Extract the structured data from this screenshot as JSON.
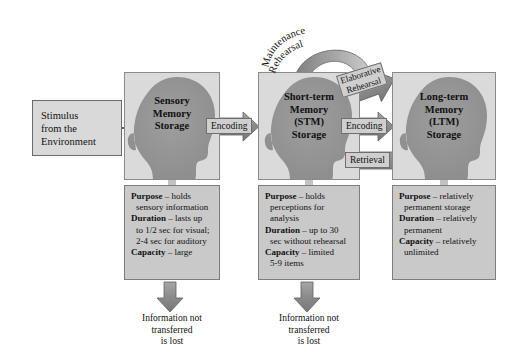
{
  "diagram": {
    "background_color": "#ffffff",
    "panel_color": "#dadada",
    "desc_box_color": "#c9c9c9",
    "arrow_color": "#8f8f8f",
    "head_color": "#9a9a9a"
  },
  "stimulus": {
    "line1": "Stimulus",
    "line2": "from the",
    "line3": "Environment"
  },
  "stages": [
    {
      "id": "sensory",
      "label_line1": "Sensory",
      "label_line2": "Memory",
      "label_line3": "Storage",
      "label_line4": "",
      "desc": {
        "purpose_key": "Purpose",
        "purpose_val": " – holds",
        "purpose_cont": "sensory information",
        "duration_key": "Duration",
        "duration_val": " – lasts up",
        "duration_cont1": "to 1/2 sec for visual;",
        "duration_cont2": "2-4 sec for auditory",
        "capacity_key": "Capacity",
        "capacity_val": " – large",
        "capacity_cont": ""
      }
    },
    {
      "id": "stm",
      "label_line1": "Short-term",
      "label_line2": "Memory",
      "label_line3": "(STM)",
      "label_line4": "Storage",
      "desc": {
        "purpose_key": "Purpose",
        "purpose_val": " – holds",
        "purpose_cont": "perceptions for",
        "purpose_cont2": "analysis",
        "duration_key": "Duration",
        "duration_val": " – up to 30",
        "duration_cont1": "sec without rehearsal",
        "capacity_key": "Capacity",
        "capacity_val": " – limited",
        "capacity_cont": "5-9 items"
      }
    },
    {
      "id": "ltm",
      "label_line1": "Long-term",
      "label_line2": "Memory",
      "label_line3": "(LTM)",
      "label_line4": "Storage",
      "desc": {
        "purpose_key": "Purpose",
        "purpose_val": " – relatively",
        "purpose_cont": "permanent storage",
        "duration_key": "Duration",
        "duration_val": " – relatively",
        "duration_cont1": "permanent",
        "capacity_key": "Capacity",
        "capacity_val": " – relatively",
        "capacity_cont": "unlimited"
      }
    }
  ],
  "arrows": {
    "encoding_1": "Encoding",
    "encoding_2": "Encoding",
    "retrieval": "Retrieval",
    "elaborative_line1": "Elaborative",
    "elaborative_line2": "Rehearsal",
    "maintenance_text": "Maintenance",
    "maintenance_text2": "Rehearsal"
  },
  "lost": {
    "sensory_line1": "Information not",
    "sensory_line2": "transferred",
    "sensory_line3": "is lost",
    "stm_line1": "Information not",
    "stm_line2": "transferred",
    "stm_line3": "is lost"
  }
}
